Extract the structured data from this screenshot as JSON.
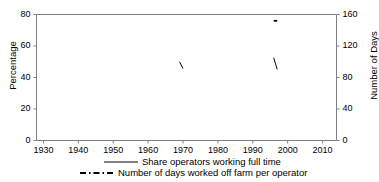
{
  "chart_data": {
    "type": "line",
    "title": "",
    "xlabel": "",
    "ylabel": "Percentage",
    "ylabel_right": "Number of Days",
    "xlim": [
      1928,
      2014
    ],
    "ylim": [
      0,
      80
    ],
    "ylim_right": [
      0,
      160
    ],
    "grid": false,
    "legend_position": "bottom",
    "xticks": [
      "1930",
      "1940",
      "1950",
      "1960",
      "1970",
      "1980",
      "1990",
      "2000",
      "2010"
    ],
    "xtick_values": [
      1930,
      1940,
      1950,
      1960,
      1970,
      1980,
      1990,
      2000,
      2010
    ],
    "yticks_left": [
      "0",
      "20",
      "40",
      "60",
      "80"
    ],
    "ytick_values_left": [
      0,
      20,
      40,
      60,
      80
    ],
    "yticks_right": [
      "0",
      "40",
      "80",
      "120",
      "160"
    ],
    "ytick_values_right": [
      0,
      40,
      80,
      120,
      160
    ],
    "series": [
      {
        "name": "Share operators working full time",
        "axis": "left",
        "style": "solid",
        "color": "#000000",
        "points": [
          [
            1930,
            69.4
          ],
          [
            1935,
            68.8
          ],
          [
            1940,
            70.2
          ],
          [
            1945,
            73.2
          ],
          [
            1950,
            65.0
          ],
          [
            1954,
            55.0
          ],
          [
            1959,
            55.5
          ],
          [
            1964,
            53.0
          ],
          [
            1969,
            50.0
          ],
          [
            1970,
            45.7
          ],
          [
            1974,
            45.4
          ],
          [
            1978,
            46.8
          ],
          [
            1982,
            46.9
          ],
          [
            1987,
            46.8
          ],
          [
            1992,
            47.8
          ],
          [
            1996,
            52.5
          ],
          [
            1997,
            45.2
          ],
          [
            2002,
            45.0
          ],
          [
            2007,
            35.7
          ],
          [
            2012,
            39.8
          ]
        ]
      },
      {
        "name": "Number of days  worked off farm per operator",
        "axis": "right",
        "style": "dashed",
        "color": "#000000",
        "points": [
          [
            1930,
            86
          ],
          [
            1935,
            84
          ],
          [
            1940,
            102
          ],
          [
            1945,
            129
          ],
          [
            1950,
            124
          ],
          [
            1954,
            118
          ],
          [
            1959,
            121
          ],
          [
            1964,
            127
          ],
          [
            1969,
            134
          ],
          [
            1974,
            143
          ],
          [
            1978,
            145
          ],
          [
            1982,
            146
          ],
          [
            1987,
            148
          ],
          [
            1992,
            150
          ],
          [
            1996,
            152
          ],
          [
            1997,
            152
          ],
          [
            2002,
            151
          ],
          [
            2007,
            139
          ],
          [
            2012,
            144
          ]
        ]
      }
    ]
  },
  "legend": {
    "items": [
      {
        "label": "Share operators working full time",
        "style": "solid"
      },
      {
        "label": "Number of days  worked off farm per operator",
        "style": "dashed"
      }
    ]
  },
  "axes": {
    "left_title": "Percentage",
    "right_title": "Number of Days"
  }
}
